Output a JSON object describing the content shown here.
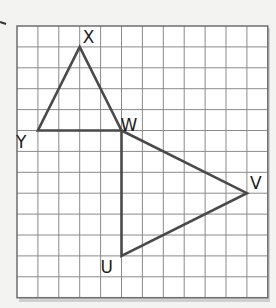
{
  "grid": {
    "origin_px": [
      17,
      26
    ],
    "cell_px": 20.9,
    "cols": 12,
    "rows": 13,
    "line_color": "#8a8a8a",
    "border_color": "#6e6e6e",
    "background": "#ffffff"
  },
  "points": {
    "X": [
      3,
      1
    ],
    "Y": [
      1,
      5
    ],
    "W": [
      5,
      5
    ],
    "V": [
      11,
      8
    ],
    "U": [
      5,
      11
    ]
  },
  "triangles": [
    {
      "name": "XYW",
      "vertices": [
        "X",
        "Y",
        "W"
      ]
    },
    {
      "name": "WVU",
      "vertices": [
        "W",
        "V",
        "U"
      ]
    }
  ],
  "labels": [
    {
      "text": "X",
      "point": "X",
      "dx": 3,
      "dy": -4
    },
    {
      "text": "Y",
      "point": "Y",
      "dx": -22,
      "dy": 17
    },
    {
      "text": "W",
      "point": "W",
      "dx": -1,
      "dy": 0
    },
    {
      "text": "V",
      "point": "V",
      "dx": 3,
      "dy": -4
    },
    {
      "text": "U",
      "point": "U",
      "dx": -21,
      "dy": 17
    }
  ],
  "stroke_color": "#4a4a4a"
}
